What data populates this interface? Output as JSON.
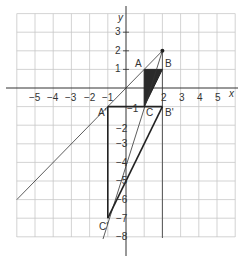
{
  "diagram": {
    "type": "coordinate-grid-enlargement",
    "axes": {
      "x_label": "x",
      "y_label": "y",
      "x_ticks": [
        "−5",
        "−4",
        "−3",
        "−2",
        "−1",
        "2",
        "3",
        "4",
        "5"
      ],
      "y_ticks": [
        "3",
        "2",
        "1",
        "−1",
        "−2",
        "−3",
        "−4",
        "−5",
        "−6",
        "−7",
        "−8"
      ],
      "x_range": [
        -6,
        6
      ],
      "y_range": [
        -8,
        4
      ]
    },
    "points": {
      "A": {
        "label": "A",
        "x": 1,
        "y": 1
      },
      "B": {
        "label": "B",
        "x": 2,
        "y": 1
      },
      "C": {
        "label": "C",
        "x": 1,
        "y": -1
      },
      "A_prime": {
        "label": "A'",
        "x": -1,
        "y": -1
      },
      "B_prime": {
        "label": "B'",
        "x": 2,
        "y": -1
      },
      "C_prime": {
        "label": "C'",
        "x": -1,
        "y": -7
      },
      "center": {
        "label": "",
        "x": 2,
        "y": 2
      }
    },
    "colors": {
      "grid": "#c8c8c8",
      "axis": "#333333",
      "shape": "#222222",
      "shaded": "#2a2a2a"
    }
  }
}
